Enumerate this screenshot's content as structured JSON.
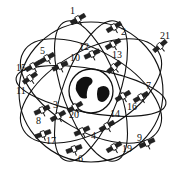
{
  "diagram": {
    "center": {
      "name": "Earth",
      "cx": 91,
      "cy": 91,
      "r": 22
    },
    "ink_color": "#111111",
    "satellites": [
      {
        "id": "1",
        "label": "1",
        "lx": 70,
        "ly": 6,
        "sx": 78,
        "sy": 19,
        "angle": -30
      },
      {
        "id": "2",
        "label": "2",
        "lx": 121,
        "ly": 27,
        "sx": 114,
        "sy": 27,
        "angle": -30
      },
      {
        "id": "21",
        "label": "21",
        "lx": 160,
        "ly": 31,
        "sx": 160,
        "sy": 46,
        "angle": -40
      },
      {
        "id": "5",
        "label": "5",
        "lx": 40,
        "ly": 46,
        "sx": 47,
        "sy": 58,
        "angle": -30
      },
      {
        "id": "12",
        "label": "12",
        "lx": 79,
        "ly": 42,
        "sx": 92,
        "sy": 54,
        "angle": -25
      },
      {
        "id": "13",
        "label": "13",
        "lx": 112,
        "ly": 50,
        "sx": 113,
        "sy": 44,
        "angle": -30
      },
      {
        "id": "10",
        "label": "10",
        "lx": 70,
        "ly": 53,
        "sx": 60,
        "sy": 66,
        "angle": -25
      },
      {
        "id": "15",
        "label": "15",
        "lx": 16,
        "ly": 63,
        "sx": 33,
        "sy": 66,
        "angle": -30
      },
      {
        "id": "11",
        "label": "11",
        "lx": 16,
        "ly": 86,
        "sx": 30,
        "sy": 78,
        "angle": -35
      },
      {
        "id": "7",
        "label": "7",
        "lx": 146,
        "ly": 81,
        "sx": 114,
        "sy": 67,
        "angle": -40
      },
      {
        "id": "16",
        "label": "16",
        "lx": 127,
        "ly": 102,
        "sx": 123,
        "sy": 96,
        "angle": -30
      },
      {
        "id": "9a",
        "label": "",
        "lx": 0,
        "ly": 0,
        "sx": 141,
        "sy": 97,
        "angle": -30
      },
      {
        "id": "8",
        "label": "8",
        "lx": 36,
        "ly": 116,
        "sx": 42,
        "sy": 110,
        "angle": -25
      },
      {
        "id": "3",
        "label": "3",
        "lx": 53,
        "ly": 100,
        "sx": 58,
        "sy": 116,
        "angle": -30
      },
      {
        "id": "20",
        "label": "20",
        "lx": 69,
        "ly": 110,
        "sx": 75,
        "sy": 107,
        "angle": -30
      },
      {
        "id": "14",
        "label": "14",
        "lx": 110,
        "ly": 109,
        "sx": 107,
        "sy": 126,
        "angle": -30
      },
      {
        "id": "4",
        "label": "4",
        "lx": 91,
        "ly": 131,
        "sx": 82,
        "sy": 131,
        "angle": -25
      },
      {
        "id": "17",
        "label": "17",
        "lx": 46,
        "ly": 136,
        "sx": 43,
        "sy": 134,
        "angle": -20
      },
      {
        "id": "6",
        "label": "6",
        "lx": 78,
        "ly": 154,
        "sx": 74,
        "sy": 149,
        "angle": -20
      },
      {
        "id": "19",
        "label": "19",
        "lx": 122,
        "ly": 144,
        "sx": 114,
        "sy": 147,
        "angle": -30
      },
      {
        "id": "9",
        "label": "9",
        "lx": 137,
        "ly": 133,
        "sx": 147,
        "sy": 143,
        "angle": -25
      }
    ]
  }
}
